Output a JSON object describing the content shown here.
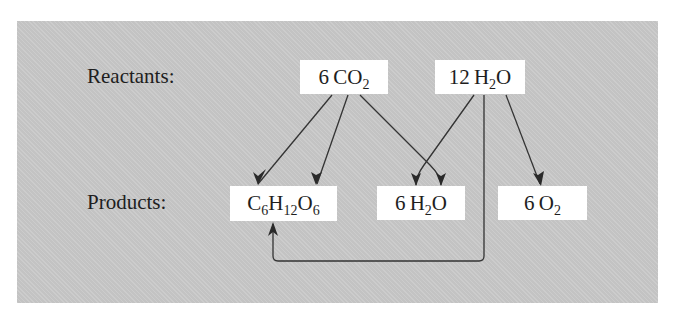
{
  "diagram": {
    "type": "reaction-flow",
    "rows": {
      "reactants_label": "Reactants:",
      "products_label": "Products:"
    },
    "reactants": [
      {
        "id": "co2",
        "coef": "6",
        "formula": [
          {
            "t": "CO"
          },
          {
            "sub": "2"
          }
        ]
      },
      {
        "id": "h2o_in",
        "coef": "12",
        "formula": [
          {
            "t": "H"
          },
          {
            "sub": "2"
          },
          {
            "t": "O"
          }
        ]
      }
    ],
    "products": [
      {
        "id": "glucose",
        "coef": "",
        "formula": [
          {
            "t": "C"
          },
          {
            "sub": "6"
          },
          {
            "t": "H"
          },
          {
            "sub": "12"
          },
          {
            "t": "O"
          },
          {
            "sub": "6"
          }
        ]
      },
      {
        "id": "h2o_out",
        "coef": "6",
        "formula": [
          {
            "t": "H"
          },
          {
            "sub": "2"
          },
          {
            "t": "O"
          }
        ]
      },
      {
        "id": "o2",
        "coef": "6",
        "formula": [
          {
            "t": "O"
          },
          {
            "sub": "2"
          }
        ]
      }
    ],
    "edges": [
      {
        "from": "co2",
        "to": "glucose"
      },
      {
        "from": "co2",
        "to": "glucose"
      },
      {
        "from": "co2",
        "to": "h2o_out"
      },
      {
        "from": "h2o_in",
        "to": "h2o_out"
      },
      {
        "from": "h2o_in",
        "to": "glucose"
      },
      {
        "from": "h2o_in",
        "to": "o2"
      }
    ],
    "colors": {
      "panel": "#c9c9c9",
      "box": "#ffffff",
      "ink": "#1e1e1e",
      "arrow": "#333333"
    }
  }
}
